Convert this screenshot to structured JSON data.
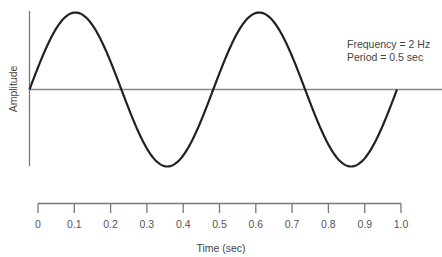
{
  "chart_data": {
    "type": "line",
    "title": "",
    "xlabel": "Time (sec)",
    "ylabel": "Amplitude",
    "xlim": [
      0,
      1.0
    ],
    "ylim": [
      -1,
      1
    ],
    "grid": false,
    "x_ticks": [
      "0",
      "0.1",
      "0.2",
      "0.3",
      "0.4",
      "0.5",
      "0.6",
      "0.7",
      "0.8",
      "0.9",
      "1.0"
    ],
    "series": [
      {
        "name": "sine wave",
        "frequency_hz": 2,
        "period_sec": 0.5,
        "x": [
          0,
          0.125,
          0.25,
          0.375,
          0.5,
          0.625,
          0.75,
          0.875,
          1.0
        ],
        "values": [
          0,
          1,
          0,
          -1,
          0,
          1,
          0,
          -1,
          0
        ]
      }
    ],
    "annotations": [
      "Frequency = 2 Hz",
      "Period = 0.5 sec"
    ],
    "colors": {
      "wave": "#222222",
      "axis": "#777777",
      "text": "#444444"
    }
  }
}
